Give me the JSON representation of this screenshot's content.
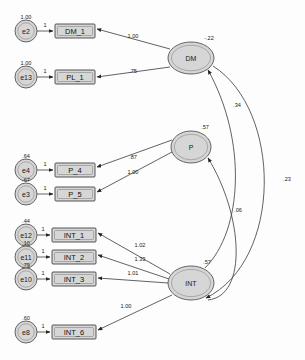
{
  "diagram": {
    "type": "sem-path-diagram",
    "title": "",
    "latent_variables": [
      {
        "id": "DM",
        "label": "DM",
        "estimate": "-.22",
        "cx": 191,
        "cy": 58,
        "rx": 23,
        "ry": 16
      },
      {
        "id": "P",
        "label": "P",
        "estimate": ".57",
        "cx": 191,
        "cy": 147,
        "rx": 20,
        "ry": 16
      },
      {
        "id": "INT",
        "label": "INT",
        "estimate": ".57",
        "cx": 191,
        "cy": 283,
        "rx": 23,
        "ry": 17
      }
    ],
    "indicators": [
      {
        "id": "DM_1",
        "label": "DM_1",
        "x": 55,
        "y": 24,
        "w": 40,
        "h": 14
      },
      {
        "id": "PL_1",
        "label": "PL_1",
        "x": 55,
        "y": 70,
        "w": 40,
        "h": 14
      },
      {
        "id": "P_4",
        "label": "P_4",
        "x": 55,
        "y": 163,
        "w": 40,
        "h": 14
      },
      {
        "id": "P_5",
        "label": "P_5",
        "x": 55,
        "y": 187,
        "w": 40,
        "h": 14
      },
      {
        "id": "INT_1",
        "label": "INT_1",
        "x": 52,
        "y": 228,
        "w": 44,
        "h": 14
      },
      {
        "id": "INT_2",
        "label": "INT_2",
        "x": 52,
        "y": 250,
        "w": 44,
        "h": 14
      },
      {
        "id": "INT_3",
        "label": "INT_3",
        "x": 52,
        "y": 272,
        "w": 44,
        "h": 14
      },
      {
        "id": "INT_6",
        "label": "INT_6",
        "x": 52,
        "y": 325,
        "w": 44,
        "h": 14
      }
    ],
    "errors": [
      {
        "id": "e2",
        "label": "e2",
        "estimate": "1.00",
        "cx": 26,
        "cy": 31,
        "r": 11
      },
      {
        "id": "e13",
        "label": "e13",
        "estimate": "1.00",
        "cx": 26,
        "cy": 77,
        "r": 11
      },
      {
        "id": "e4",
        "label": "e4",
        "estimate": ".64",
        "cx": 26,
        "cy": 170,
        "r": 11
      },
      {
        "id": "e3",
        "label": "e3",
        "estimate": ".67",
        "cx": 26,
        "cy": 194,
        "r": 11
      },
      {
        "id": "e12",
        "label": "e12",
        "estimate": ".44",
        "cx": 26,
        "cy": 235,
        "r": 11
      },
      {
        "id": "e11",
        "label": "e11",
        "estimate": ".10",
        "cx": 26,
        "cy": 257,
        "r": 11
      },
      {
        "id": "e10",
        "label": "e10",
        "estimate": ".79",
        "cx": 26,
        "cy": 279,
        "r": 11
      },
      {
        "id": "e8",
        "label": "e8",
        "estimate": ".60",
        "cx": 26,
        "cy": 332,
        "r": 11
      }
    ],
    "error_paths": [
      {
        "from": "e2",
        "to": "DM_1",
        "estimate": "1"
      },
      {
        "from": "e13",
        "to": "PL_1",
        "estimate": "1"
      },
      {
        "from": "e4",
        "to": "P_4",
        "estimate": "1"
      },
      {
        "from": "e3",
        "to": "P_5",
        "estimate": "1"
      },
      {
        "from": "e12",
        "to": "INT_1",
        "estimate": "1"
      },
      {
        "from": "e11",
        "to": "INT_2",
        "estimate": "1"
      },
      {
        "from": "e10",
        "to": "INT_3",
        "estimate": "1"
      },
      {
        "from": "e8",
        "to": "INT_6",
        "estimate": "1"
      }
    ],
    "loadings": [
      {
        "from": "DM",
        "to": "DM_1",
        "estimate": "1.00",
        "lx": 133,
        "ly": 36
      },
      {
        "from": "DM",
        "to": "PL_1",
        "estimate": ".75",
        "lx": 133,
        "ly": 71
      },
      {
        "from": "P",
        "to": "P_4",
        "estimate": ".87",
        "lx": 133,
        "ly": 157
      },
      {
        "from": "P",
        "to": "P_5",
        "estimate": "1.00",
        "lx": 133,
        "ly": 172
      },
      {
        "from": "INT",
        "to": "INT_1",
        "estimate": "1.02",
        "lx": 140,
        "ly": 245
      },
      {
        "from": "INT",
        "to": "INT_2",
        "estimate": "1.33",
        "lx": 140,
        "ly": 259
      },
      {
        "from": "INT",
        "to": "INT_3",
        "estimate": "1.01",
        "lx": 133,
        "ly": 273
      },
      {
        "from": "INT",
        "to": "INT_6",
        "estimate": "1.00",
        "lx": 126,
        "ly": 306
      }
    ],
    "structural_paths": [
      {
        "from": "INT",
        "to": "DM",
        "estimate": ".34",
        "lx": 237,
        "ly": 105
      },
      {
        "from": "INT",
        "to": "P",
        "estimate": ".06",
        "lx": 238,
        "ly": 210
      },
      {
        "from": "DM",
        "to": "P",
        "estimate": ".23",
        "lx": 285,
        "ly": 179
      }
    ]
  }
}
